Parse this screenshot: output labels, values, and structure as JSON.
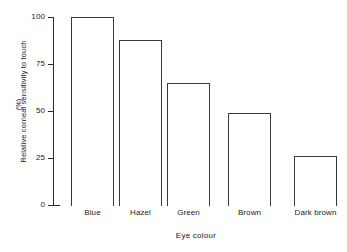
{
  "chart_data": {
    "type": "bar",
    "title": "",
    "subtitle": "",
    "xlabel": "Eye colour",
    "ylabel": "Relative corneal sensitivity to touch",
    "ylabel_units": "(%)",
    "categories": [
      "Blue",
      "Hazel",
      "Green",
      "Brown",
      "Dark brown"
    ],
    "values": [
      100,
      88,
      65,
      49,
      26
    ],
    "ylim": [
      0,
      100
    ],
    "yticks": [
      100,
      75,
      50,
      25,
      0
    ],
    "ytick_labels": [
      "100",
      "75",
      "50",
      "25",
      "0"
    ],
    "grid": false,
    "legend": null,
    "annotations": [],
    "bar_fill": "#ffffff",
    "bar_edge_color": "#3a3a3a",
    "axis_color": "#2b2b2b",
    "background": "#ffffff"
  },
  "geometry": {
    "plot_left": 53,
    "plot_right": 339,
    "plot_top": 17,
    "plot_bottom": 205,
    "bar_width": 43,
    "bar_lefts": [
      71,
      119,
      167,
      228,
      294
    ],
    "tick_y": [
      17,
      64,
      111,
      158,
      205
    ],
    "bar_tops": [
      17,
      40,
      83,
      113,
      156
    ]
  }
}
